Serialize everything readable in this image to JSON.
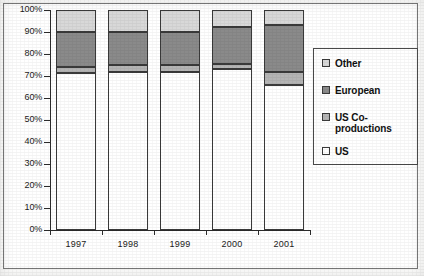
{
  "chart_data": {
    "type": "bar",
    "subtype": "100% stacked column",
    "title": "",
    "xlabel": "",
    "ylabel": "",
    "categories": [
      "1997",
      "1998",
      "1999",
      "2000",
      "2001"
    ],
    "ylim": [
      0,
      100
    ],
    "ytick_labels": [
      "0%",
      "10%",
      "20%",
      "30%",
      "40%",
      "50%",
      "60%",
      "70%",
      "80%",
      "90%",
      "100%"
    ],
    "ytick_values": [
      0,
      10,
      20,
      30,
      40,
      50,
      60,
      70,
      80,
      90,
      100
    ],
    "grid": false,
    "legend_position": "right",
    "stack_order_bottom_to_top": [
      "US",
      "US Co-productions",
      "European",
      "Other"
    ],
    "series": [
      {
        "name": "US",
        "color": "#ffffff",
        "values": [
          71.5,
          72.0,
          72.0,
          73.0,
          66.0
        ]
      },
      {
        "name": "US Co-productions",
        "color": "#b4b4b4",
        "values": [
          2.5,
          3.0,
          3.0,
          2.5,
          6.0
        ]
      },
      {
        "name": "European",
        "color": "#8a8a8a",
        "values": [
          16.0,
          15.0,
          15.0,
          17.0,
          21.0
        ]
      },
      {
        "name": "Other",
        "color": "#d8d8d8",
        "values": [
          10.0,
          10.0,
          10.0,
          7.5,
          7.0
        ]
      }
    ]
  },
  "legend": {
    "items": [
      {
        "label": "Other",
        "color": "#d8d8d8"
      },
      {
        "label": "European",
        "color": "#8a8a8a"
      },
      {
        "label": "US Co-\nproductions",
        "color": "#b4b4b4"
      },
      {
        "label": "US",
        "color": "#ffffff"
      }
    ]
  }
}
